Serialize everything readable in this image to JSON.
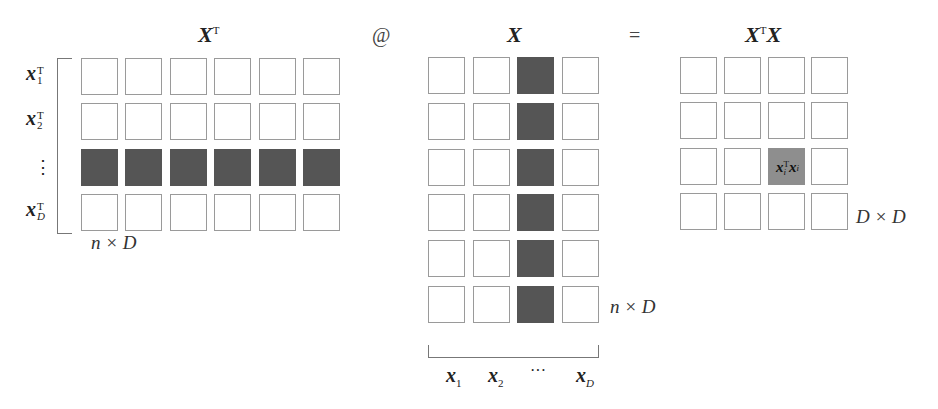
{
  "diagram": {
    "titles": {
      "xt": {
        "base": "X",
        "sup": "T"
      },
      "x": {
        "base": "X"
      },
      "xtx": {
        "base1": "X",
        "sup": "T",
        "base2": "X"
      }
    },
    "operators": {
      "matmul": "@",
      "equals": "="
    },
    "xt_matrix": {
      "rows": 4,
      "cols": 6,
      "highlighted_row": 3,
      "row_labels": [
        {
          "base": "x",
          "sup": "T",
          "sub": "1"
        },
        {
          "base": "x",
          "sup": "T",
          "sub": "2"
        },
        {
          "base": "⋮"
        },
        {
          "base": "x",
          "sup": "T",
          "sub": "D"
        }
      ],
      "dimension": "n × D"
    },
    "x_matrix": {
      "rows": 6,
      "cols": 4,
      "highlighted_col": 3,
      "col_labels": [
        {
          "base": "x",
          "sub": "1"
        },
        {
          "base": "x",
          "sub": "2"
        },
        {
          "base": "···"
        },
        {
          "base": "x",
          "sub": "D"
        }
      ],
      "dimension": "n × D"
    },
    "xtx_matrix": {
      "rows": 4,
      "cols": 4,
      "highlighted_cell": [
        3,
        3
      ],
      "cell_label": {
        "a": "x",
        "a_sup": "T",
        "a_sub": "i",
        "b": "x",
        "b_sub": "i"
      },
      "dimension": "D × D"
    },
    "colors": {
      "dark_fill": "#555555",
      "highlight_fill": "#8e8e8e",
      "border": "#9a9a9a"
    }
  }
}
